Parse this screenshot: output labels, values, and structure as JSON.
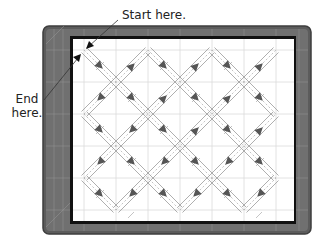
{
  "annotations": {
    "start_label": "Start here.",
    "end_label_line1": "End",
    "end_label_line2": "here."
  },
  "colors": {
    "mat_fill": "#6b6b6b",
    "mat_border": "#4a4a4a",
    "mat_grid": "#9a9a9a",
    "block_fill": "#ffffff",
    "block_grid": "#d8d8d8",
    "stitch_line": "#8a8a8a",
    "arrow": "#555555",
    "shadow": "#111111"
  },
  "diagram": {
    "grid_x": [
      84,
      116,
      148,
      180,
      212,
      244,
      276
    ],
    "grid_y": [
      50,
      82,
      114,
      146,
      178,
      210
    ],
    "start_point": [
      84,
      50
    ],
    "end_point": [
      84,
      50
    ]
  }
}
